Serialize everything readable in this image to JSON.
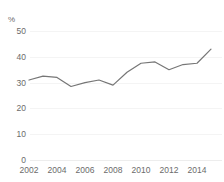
{
  "top_caption": "",
  "chart_data": {
    "type": "line",
    "title": "",
    "subtitle": "",
    "xlabel": "",
    "ylabel": "%",
    "unit_label": "%",
    "x": [
      2002,
      2003,
      2004,
      2005,
      2006,
      2007,
      2008,
      2009,
      2010,
      2011,
      2012,
      2013,
      2014,
      2015
    ],
    "values": [
      31,
      32.5,
      32,
      28.5,
      30,
      31,
      29,
      34,
      37.5,
      38,
      35,
      37,
      37.5,
      43
    ],
    "series": [
      {
        "name": "",
        "color": "#767676",
        "values": [
          31,
          32.5,
          32,
          28.5,
          30,
          31,
          29,
          34,
          37.5,
          38,
          35,
          37,
          37.5,
          43
        ]
      }
    ],
    "xlim": [
      2002,
      2015
    ],
    "ylim": [
      0,
      50
    ],
    "ytick_labels": [
      "50",
      "40",
      "30",
      "20",
      "10",
      "0"
    ],
    "ytick_values": [
      50,
      40,
      30,
      20,
      10,
      0
    ],
    "xtick_labels": [
      "2002",
      "2004",
      "2006",
      "2008",
      "2010",
      "2012",
      "2014"
    ],
    "xtick_values": [
      2002,
      2004,
      2006,
      2008,
      2010,
      2012,
      2014
    ],
    "grid": true,
    "grid_color": "#f4f4f4",
    "legend": false,
    "legend_position": "none",
    "line_color": "#767676",
    "background_color": "#ffffff",
    "text_color": "#6b6b6b"
  }
}
